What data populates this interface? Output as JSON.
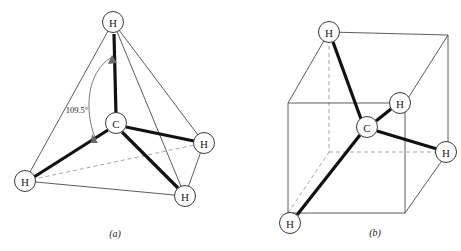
{
  "figure": {
    "background_color": "#ffffff",
    "bond_color": "#111111",
    "edge_color": "#4a4a4a",
    "dashed_color": "#9a9a9a",
    "atom_fill": "#ffffff",
    "atom_stroke": "#3a3a3a"
  },
  "panel_a": {
    "caption": "(a)",
    "caption_pos": {
      "x": 115,
      "y": 233
    },
    "angle": {
      "text": "109.5°",
      "x": 77,
      "y": 110
    },
    "atoms": [
      {
        "id": "h-top",
        "label": "H",
        "x": 113,
        "y": 22,
        "r": 10.5
      },
      {
        "id": "carbon-center",
        "label": "C",
        "x": 116,
        "y": 123,
        "r": 10.5
      },
      {
        "id": "h-left",
        "label": "H",
        "x": 25,
        "y": 181,
        "r": 10.5
      },
      {
        "id": "h-bottom",
        "label": "H",
        "x": 185,
        "y": 196,
        "r": 10.5
      },
      {
        "id": "h-right",
        "label": "H",
        "x": 204,
        "y": 143,
        "r": 10.5
      }
    ],
    "bonds": [
      {
        "id": "bond-c-htop",
        "from": "carbon-center",
        "to": "h-top",
        "style": "bold"
      },
      {
        "id": "bond-c-hleft",
        "from": "carbon-center",
        "to": "h-left",
        "style": "bold"
      },
      {
        "id": "bond-c-hbottom",
        "from": "carbon-center",
        "to": "h-bottom",
        "style": "bold"
      },
      {
        "id": "bond-c-hright",
        "from": "carbon-center",
        "to": "h-right",
        "style": "bold"
      }
    ],
    "tetrahedron_edges": [
      {
        "id": "edge-htop-hleft",
        "from": "h-top",
        "to": "h-left",
        "style": "solid"
      },
      {
        "id": "edge-htop-hbottom",
        "from": "h-top",
        "to": "h-bottom",
        "style": "solid"
      },
      {
        "id": "edge-htop-hright",
        "from": "h-top",
        "to": "h-right",
        "style": "solid"
      },
      {
        "id": "edge-hleft-hbottom",
        "from": "h-left",
        "to": "h-bottom",
        "style": "solid"
      },
      {
        "id": "edge-hbottom-hright",
        "from": "h-bottom",
        "to": "h-right",
        "style": "solid"
      },
      {
        "id": "edge-hleft-hright",
        "from": "h-left",
        "to": "h-right",
        "style": "dashed"
      }
    ]
  },
  "panel_b": {
    "caption": "(b)",
    "caption_pos": {
      "x": 145,
      "y": 232
    },
    "atoms": [
      {
        "id": "h-topleft",
        "label": "H",
        "x": 99,
        "y": 32,
        "r": 10.5
      },
      {
        "id": "carbon-center",
        "label": "C",
        "x": 137,
        "y": 127,
        "r": 10.5
      },
      {
        "id": "h-upperright",
        "label": "H",
        "x": 170,
        "y": 103,
        "r": 10.5
      },
      {
        "id": "h-right",
        "label": "H",
        "x": 216,
        "y": 152,
        "r": 10.5
      },
      {
        "id": "h-bottomleft",
        "label": "H",
        "x": 60,
        "y": 223,
        "r": 10.5
      }
    ],
    "bonds": [
      {
        "id": "bond-c-htopleft",
        "from": "carbon-center",
        "to": "h-topleft",
        "style": "bold"
      },
      {
        "id": "bond-c-hupperright",
        "from": "carbon-center",
        "to": "h-upperright",
        "style": "bold"
      },
      {
        "id": "bond-c-hright",
        "from": "carbon-center",
        "to": "h-right",
        "style": "bold"
      },
      {
        "id": "bond-c-hbottomleft",
        "from": "carbon-center",
        "to": "h-bottomleft",
        "style": "bold"
      }
    ],
    "cube_vertices": {
      "front_top_left": {
        "x": 58,
        "y": 103
      },
      "front_top_right": {
        "x": 175,
        "y": 103
      },
      "front_bot_left": {
        "x": 58,
        "y": 213
      },
      "front_bot_right": {
        "x": 175,
        "y": 213
      },
      "back_top_left": {
        "x": 99,
        "y": 32
      },
      "back_top_right": {
        "x": 218,
        "y": 35
      },
      "back_bot_left": {
        "x": 99,
        "y": 152
      },
      "back_bot_right": {
        "x": 218,
        "y": 152
      }
    },
    "cube_edges_solid": [
      "front_top_left-front_top_right",
      "front_top_left-front_bot_left",
      "front_top_right-front_bot_right",
      "front_bot_left-front_bot_right",
      "front_top_left-back_top_left",
      "front_top_right-back_top_right",
      "front_bot_right-back_bot_right",
      "back_top_left-back_top_right",
      "back_top_right-back_bot_right"
    ],
    "cube_edges_dashed": [
      "back_top_left-back_bot_left",
      "back_bot_left-back_bot_right",
      "front_bot_left-back_bot_left"
    ]
  }
}
